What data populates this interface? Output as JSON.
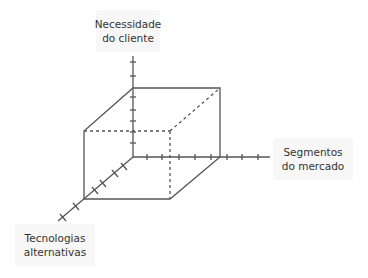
{
  "diagram": {
    "type": "3d-cube-axes",
    "axes": {
      "vertical": {
        "label_line1": "Necessidade",
        "label_line2": "do cliente"
      },
      "horizontal": {
        "label_line1": "Segmentos",
        "label_line2": "do mercado"
      },
      "depth": {
        "label_line1": "Tecnologias",
        "label_line2": "alternativas"
      }
    },
    "colors": {
      "line": "#555555",
      "label_bg": "#f7f7f7",
      "text": "#333333"
    }
  }
}
